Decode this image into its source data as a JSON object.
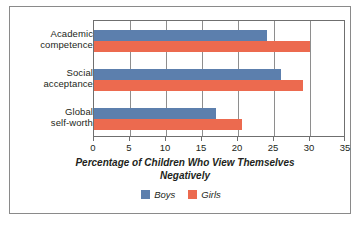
{
  "chart_data": {
    "type": "bar",
    "orientation": "horizontal",
    "title": "",
    "xlabel": "Percentage of Children Who View Themselves Negatively",
    "ylabel": "",
    "xlim": [
      0,
      35
    ],
    "xticks": [
      0,
      5,
      10,
      15,
      20,
      25,
      30,
      35
    ],
    "grid": true,
    "grid_axis": "x",
    "legend_position": "bottom-center",
    "categories": [
      "Academic competence",
      "Social acceptance",
      "Global self-worth"
    ],
    "category_lines": [
      [
        "Academic",
        "competence"
      ],
      [
        "Social",
        "acceptance"
      ],
      [
        "Global",
        "self-worth"
      ]
    ],
    "series": [
      {
        "name": "Boys",
        "color": "#5c7fad",
        "values": [
          24,
          26,
          17
        ]
      },
      {
        "name": "Girls",
        "color": "#ec6a4f",
        "values": [
          30,
          29,
          20.5
        ]
      }
    ]
  },
  "axis_title_lines": [
    "Percentage of Children Who View Themselves",
    "Negatively"
  ],
  "colors": {
    "boys": "#5c7fad",
    "girls": "#ec6a4f",
    "frame": "#8a8a8a",
    "plot_border": "#6f6f6f",
    "gridline": "#8e8e8e",
    "text": "#231f20",
    "background": "#ffffff"
  }
}
